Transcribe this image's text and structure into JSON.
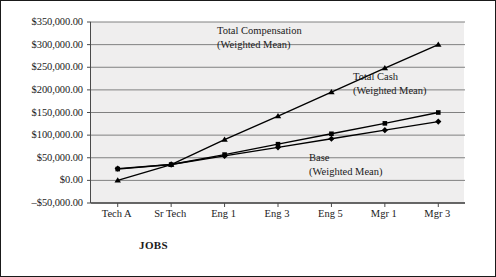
{
  "chart_data": {
    "type": "line",
    "title": "",
    "xlabel": "JOBS",
    "ylabel": "",
    "categories": [
      "Tech A",
      "Sr Tech",
      "Eng 1",
      "Eng 3",
      "Eng 5",
      "Mgr 1",
      "Mgr 3"
    ],
    "ylim": [
      -50000,
      350000
    ],
    "ytick_values": [
      350000,
      300000,
      250000,
      200000,
      150000,
      100000,
      50000,
      0,
      -50000
    ],
    "ytick_labels": [
      "$350,000.00",
      "$300,000.00",
      "$250,000.00",
      "$200,000.00",
      "$150,000.00",
      "$100,000.00",
      "$50,000.00",
      "$0.00",
      "–$50,000.00"
    ],
    "grid": true,
    "legend_position": "inline-annotations",
    "series": [
      {
        "name": "Total Compensation (Weighted Mean)",
        "marker": "triangle",
        "values": [
          0,
          35000,
          90000,
          142000,
          195000,
          248000,
          300000
        ]
      },
      {
        "name": "Total Cash (Weighted Mean)",
        "marker": "square",
        "values": [
          25000,
          35000,
          57000,
          80000,
          103000,
          126000,
          150000
        ]
      },
      {
        "name": "Base (Weighted Mean)",
        "marker": "diamond",
        "values": [
          26000,
          35000,
          54000,
          73000,
          92000,
          111000,
          130000
        ]
      }
    ],
    "annotations": [
      {
        "name": "total-compensation",
        "line1": "Total Compensation",
        "line2": "(Weighted Mean)"
      },
      {
        "name": "total-cash",
        "line1": "Total Cash",
        "line2": "(Weighted Mean)"
      },
      {
        "name": "base",
        "line1": "Base",
        "line2": "(Weighted Mean)"
      }
    ],
    "colors": {
      "series_line": "#000000",
      "plot_background": "#efeeee",
      "gridline": "#808080",
      "axis": "#4a4a4a",
      "figure_border": "#1a1a1a",
      "text": "#1a1a1a"
    }
  }
}
